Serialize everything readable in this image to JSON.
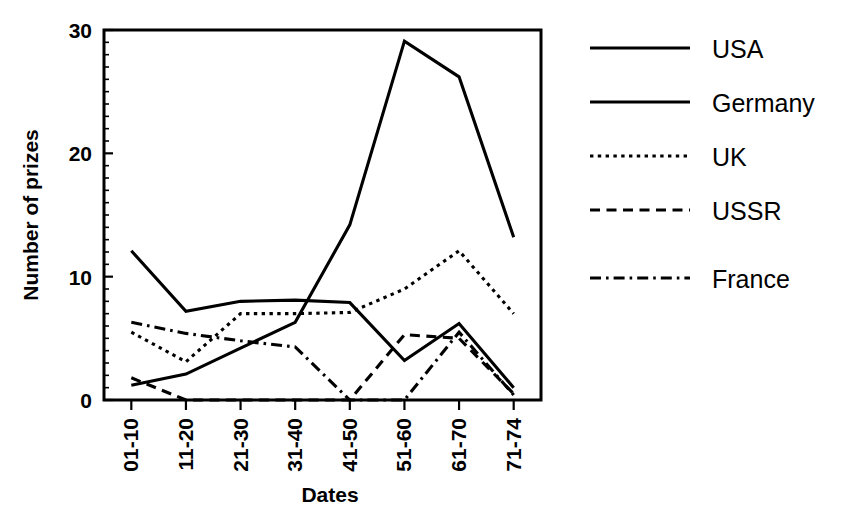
{
  "chart_data": {
    "type": "line",
    "title": "",
    "xlabel": "Dates",
    "ylabel": "Number of prizes",
    "categories": [
      "01-10",
      "11-20",
      "21-30",
      "31-40",
      "41-50",
      "51-60",
      "61-70",
      "71-74"
    ],
    "ylim": [
      0,
      30
    ],
    "yticks": [
      0,
      10,
      20,
      30
    ],
    "ytick_labels": [
      "0",
      "10",
      "20",
      "30"
    ],
    "y_minor_tick_step": 1,
    "grid": false,
    "legend_position": "right",
    "series": [
      {
        "name": "USA",
        "linestyle": "solid",
        "values": [
          1.2,
          2.1,
          4.2,
          6.3,
          14.2,
          29.1,
          26.2,
          13.2
        ]
      },
      {
        "name": "Germany",
        "linestyle": "solid",
        "values": [
          12.1,
          7.2,
          8.0,
          8.1,
          7.9,
          3.2,
          6.2,
          1.0
        ]
      },
      {
        "name": "UK",
        "linestyle": "dotted",
        "values": [
          5.5,
          3.1,
          7.0,
          7.0,
          7.1,
          9.0,
          12.1,
          7.0
        ]
      },
      {
        "name": "USSR",
        "linestyle": "dashed",
        "values": [
          1.8,
          0.0,
          0.0,
          0.0,
          0.0,
          5.3,
          5.0,
          0.5
        ]
      },
      {
        "name": "France",
        "linestyle": "dashdot",
        "values": [
          6.3,
          5.4,
          4.8,
          4.3,
          0.0,
          0.0,
          5.5,
          0.4
        ]
      }
    ]
  },
  "axes": {
    "ylabel": "Number of prizes",
    "xlabel": "Dates"
  },
  "legend": {
    "items": [
      {
        "label": "USA",
        "linestyle": "solid"
      },
      {
        "label": "Germany",
        "linestyle": "solid"
      },
      {
        "label": "UK",
        "linestyle": "dotted"
      },
      {
        "label": "USSR",
        "linestyle": "dashed"
      },
      {
        "label": "France",
        "linestyle": "dashdot"
      }
    ]
  },
  "colors": {
    "ink": "#000000",
    "background": "#ffffff"
  }
}
